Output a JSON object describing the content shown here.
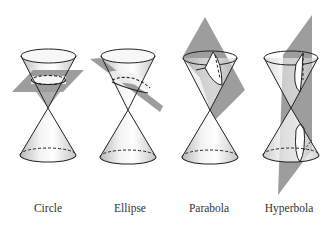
{
  "diagram": {
    "panels": [
      {
        "label": "Circle",
        "plane": "horizontal"
      },
      {
        "label": "Ellipse",
        "plane": "tilted"
      },
      {
        "label": "Parabola",
        "plane": "parallel-to-side"
      },
      {
        "label": "Hyperbola",
        "plane": "vertical"
      }
    ]
  },
  "colors": {
    "line": "#222222",
    "plane": "#8c8c8c",
    "cone_fill": "#e8e8e8",
    "background": "#ffffff"
  }
}
